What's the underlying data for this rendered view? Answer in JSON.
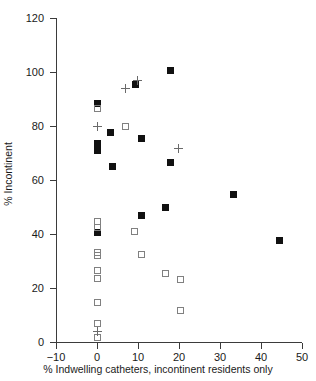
{
  "chart_data": {
    "type": "scatter",
    "title": "",
    "xlabel": "% Indwelling catheters, incontinent residents only",
    "ylabel": "% Incontinent",
    "xlim": [
      -10,
      50
    ],
    "ylim": [
      0,
      120
    ],
    "xticks": [
      -10,
      0,
      10,
      20,
      30,
      40,
      50
    ],
    "yticks": [
      0,
      20,
      40,
      60,
      80,
      100,
      120
    ],
    "xtick_labels": [
      "−10",
      "0",
      "10",
      "20",
      "30",
      "40",
      "50"
    ],
    "ytick_labels": [
      "0",
      "20",
      "40",
      "60",
      "80",
      "100",
      "120"
    ],
    "grid": false,
    "legend": "none",
    "series": [
      {
        "name": "filled-square",
        "marker": "filled square",
        "color": "#111111",
        "points": [
          [
            0.0,
            88.5
          ],
          [
            0.0,
            73.5
          ],
          [
            0.0,
            71.0
          ],
          [
            0.0,
            40.5
          ],
          [
            3.3,
            77.5
          ],
          [
            3.8,
            65.0
          ],
          [
            9.4,
            95.5
          ],
          [
            10.8,
            75.5
          ],
          [
            10.8,
            47.0
          ],
          [
            16.8,
            50.0
          ],
          [
            17.9,
            100.5
          ],
          [
            18.0,
            66.5
          ],
          [
            33.2,
            54.5
          ],
          [
            44.4,
            37.5
          ]
        ]
      },
      {
        "name": "open-square",
        "marker": "open square",
        "color": "#808080",
        "points": [
          [
            0.0,
            86.5
          ],
          [
            0.0,
            44.5
          ],
          [
            0.0,
            42.5
          ],
          [
            0.0,
            33.0
          ],
          [
            0.0,
            32.0
          ],
          [
            0.0,
            26.5
          ],
          [
            0.0,
            23.5
          ],
          [
            0.0,
            14.5
          ],
          [
            0.0,
            7.0
          ],
          [
            0.0,
            1.5
          ],
          [
            7.0,
            80.0
          ],
          [
            9.1,
            41.0
          ],
          [
            10.8,
            32.5
          ],
          [
            16.8,
            25.5
          ],
          [
            20.3,
            23.0
          ],
          [
            20.3,
            11.5
          ]
        ]
      },
      {
        "name": "plus",
        "marker": "plus",
        "color": "#6a6a6a",
        "points": [
          [
            0.0,
            80.0
          ],
          [
            0.0,
            4.0
          ],
          [
            6.9,
            94.0
          ],
          [
            9.9,
            97.0
          ],
          [
            19.9,
            71.5
          ]
        ]
      }
    ]
  }
}
